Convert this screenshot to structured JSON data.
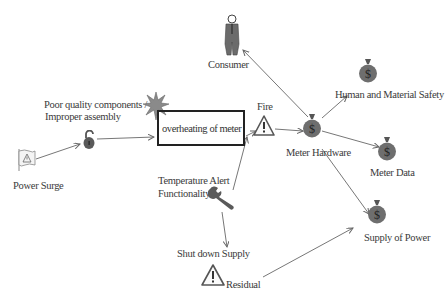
{
  "nodes": {
    "consumer": {
      "label": "Consumer",
      "icon": "person-icon"
    },
    "poor_quality": {
      "label_line1": "Poor quality components /",
      "label_line2": "Improper assembly",
      "icon": "unlocked-padlock-icon"
    },
    "power_surge": {
      "label": "Power Surge",
      "icon": "warning-flag-icon"
    },
    "overheating": {
      "label": "overheating of meter",
      "icon": "explosion-starburst-icon"
    },
    "fire": {
      "label": "Fire",
      "icon": "warning-triangle-icon"
    },
    "meter_hardware": {
      "label": "Meter Hardware",
      "icon": "money-bag-icon"
    },
    "human_safety": {
      "label": "Human and Material Safety",
      "icon": "money-bag-icon"
    },
    "meter_data": {
      "label": "Meter Data",
      "icon": "money-bag-icon"
    },
    "supply_power": {
      "label": "Supply of Power",
      "icon": "money-bag-icon"
    },
    "temp_alert": {
      "label_line1": "Temperature Alert",
      "label_line2": "Functionality",
      "icon": "wrench-icon"
    },
    "shutdown": {
      "label": "Shut down  Supply",
      "icon": "warning-triangle-icon"
    },
    "residual": {
      "label": "Residual"
    }
  },
  "edges": [
    {
      "from": "Power Surge",
      "to": "Poor quality components / Improper assembly"
    },
    {
      "from": "Poor quality components / Improper assembly",
      "to": "overheating of meter"
    },
    {
      "from": "overheating of meter",
      "to": "Fire"
    },
    {
      "from": "Temperature Alert Functionality",
      "to": "Fire"
    },
    {
      "from": "Temperature Alert Functionality",
      "to": "Shut down Supply"
    },
    {
      "from": "Fire",
      "to": "Meter Hardware"
    },
    {
      "from": "Meter Hardware",
      "to": "Consumer"
    },
    {
      "from": "Meter Hardware",
      "to": "Human and Material Safety"
    },
    {
      "from": "Meter Hardware",
      "to": "Meter Data"
    },
    {
      "from": "Meter Hardware",
      "to": "Supply of Power"
    },
    {
      "from": "Residual",
      "to": "Supply of Power"
    }
  ],
  "colors": {
    "icon_gray": "#6e6e6e",
    "line": "#6a6a6a",
    "box_border": "#222222"
  }
}
